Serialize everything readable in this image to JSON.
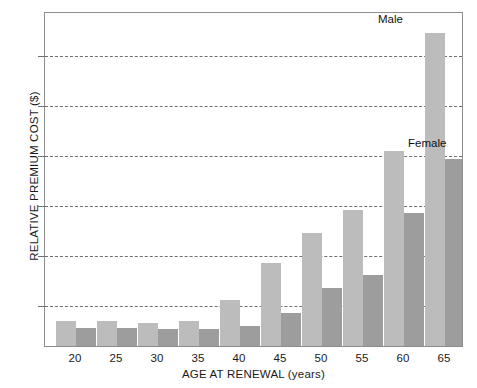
{
  "chart_data": {
    "type": "bar",
    "title": "",
    "xlabel": "AGE AT RENEWAL (years)",
    "ylabel": "RELATIVE PREMIUM COST ($)",
    "categories": [
      "20",
      "25",
      "30",
      "35",
      "40",
      "45",
      "50",
      "55",
      "60",
      "65"
    ],
    "series": [
      {
        "name": "Male",
        "color": "#bcbcbc",
        "values": [
          0.75,
          0.75,
          0.7,
          0.75,
          1.4,
          2.5,
          3.4,
          4.1,
          5.9,
          9.45
        ]
      },
      {
        "name": "Female",
        "color": "#9d9d9d",
        "values": [
          0.55,
          0.55,
          0.5,
          0.5,
          0.6,
          1.0,
          1.75,
          2.15,
          4.0,
          5.65
        ]
      }
    ],
    "ylim": [
      0,
      10.05
    ],
    "yticks": [
      1.5,
      3.0,
      4.5,
      6.0,
      7.5,
      9.0
    ],
    "ytick_labels": [
      "",
      "",
      "",
      "",
      "",
      ""
    ],
    "grid": true,
    "grid_style": "dashed",
    "grid_axis": "y",
    "legend_position": "inline-annotations",
    "annotations": [
      {
        "text": "Male",
        "target": "65 male bar",
        "position": "above"
      },
      {
        "text": "Female",
        "target": "65 female bar",
        "position": "above"
      }
    ]
  }
}
